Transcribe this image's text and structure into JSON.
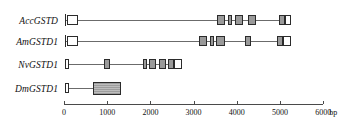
{
  "figure": {
    "type": "gene-structure-diagram",
    "axis": {
      "unit_label": "bp",
      "ticks": [
        "0",
        "1000",
        "2000",
        "3000",
        "4000",
        "5000",
        "6000"
      ],
      "tick_values": [
        0,
        1000,
        2000,
        3000,
        4000,
        5000,
        6000
      ],
      "range": [
        0,
        6000
      ],
      "pixels_per_1000bp": 43.2,
      "origin_x_px": 64
    },
    "colors": {
      "exon_fill": "#9a9a9a",
      "exon_stroke": "#2b2b2b",
      "utr_fill": "#ffffff",
      "line": "#6b6b6b",
      "axis": "#4a4a4a",
      "text": "#111111"
    },
    "rows": [
      {
        "label": "AccGSTD",
        "track_start_bp": 20,
        "track_end_bp": 5250,
        "features": [
          {
            "kind": "start-bar",
            "start_bp": 20,
            "end_bp": 20
          },
          {
            "kind": "utr",
            "start_bp": 60,
            "end_bp": 330
          },
          {
            "kind": "exon",
            "start_bp": 3540,
            "end_bp": 3720
          },
          {
            "kind": "exon",
            "start_bp": 3790,
            "end_bp": 3900
          },
          {
            "kind": "exon",
            "start_bp": 3960,
            "end_bp": 4150
          },
          {
            "kind": "exon",
            "start_bp": 4250,
            "end_bp": 4440
          },
          {
            "kind": "exon",
            "start_bp": 4980,
            "end_bp": 5110
          },
          {
            "kind": "utr",
            "start_bp": 5110,
            "end_bp": 5250
          }
        ]
      },
      {
        "label": "AmGSTD1",
        "track_start_bp": 20,
        "track_end_bp": 5260,
        "features": [
          {
            "kind": "start-bar",
            "start_bp": 20,
            "end_bp": 20
          },
          {
            "kind": "utr",
            "start_bp": 60,
            "end_bp": 330
          },
          {
            "kind": "exon",
            "start_bp": 3120,
            "end_bp": 3320
          },
          {
            "kind": "exon",
            "start_bp": 3380,
            "end_bp": 3480
          },
          {
            "kind": "exon",
            "start_bp": 3530,
            "end_bp": 3720
          },
          {
            "kind": "exon",
            "start_bp": 4180,
            "end_bp": 4340
          },
          {
            "kind": "exon",
            "start_bp": 4940,
            "end_bp": 5080
          },
          {
            "kind": "utr",
            "start_bp": 5080,
            "end_bp": 5260
          }
        ]
      },
      {
        "label": "NvGSTD1",
        "track_start_bp": 20,
        "track_end_bp": 2740,
        "features": [
          {
            "kind": "utr",
            "start_bp": 20,
            "end_bp": 110
          },
          {
            "kind": "exon",
            "start_bp": 930,
            "end_bp": 1070
          },
          {
            "kind": "exon",
            "start_bp": 1830,
            "end_bp": 1920
          },
          {
            "kind": "exon",
            "start_bp": 1970,
            "end_bp": 2140
          },
          {
            "kind": "exon",
            "start_bp": 2200,
            "end_bp": 2360
          },
          {
            "kind": "exon",
            "start_bp": 2400,
            "end_bp": 2540
          },
          {
            "kind": "utr",
            "start_bp": 2540,
            "end_bp": 2740
          }
        ]
      },
      {
        "label": "DmGSTD1",
        "track_start_bp": 20,
        "track_end_bp": 1320,
        "features": [
          {
            "kind": "utr",
            "start_bp": 20,
            "end_bp": 110
          },
          {
            "kind": "big-exon",
            "start_bp": 680,
            "end_bp": 1320
          }
        ]
      }
    ]
  }
}
